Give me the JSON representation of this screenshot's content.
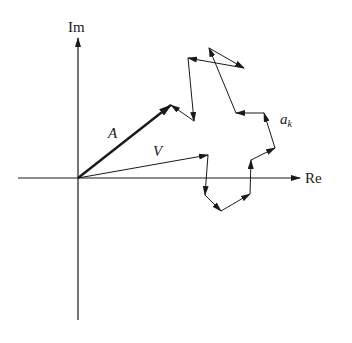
{
  "diagram": {
    "axes": {
      "x_label": "Re",
      "y_label": "Im",
      "origin": [
        78,
        178
      ]
    },
    "labels": {
      "resultant": "A",
      "vector_v": "V",
      "component": "a",
      "component_subscript": "k"
    },
    "vectors": {
      "A": {
        "from": [
          78,
          178
        ],
        "to": [
          171,
          105
        ]
      },
      "V": {
        "from": [
          78,
          178
        ],
        "to": [
          208,
          155
        ]
      }
    },
    "chain_points": [
      [
        208,
        155
      ],
      [
        205,
        195
      ],
      [
        221,
        211
      ],
      [
        250,
        194
      ],
      [
        251,
        160
      ],
      [
        275,
        148
      ],
      [
        264,
        113
      ],
      [
        236,
        113
      ],
      [
        209,
        48
      ],
      [
        244,
        68
      ],
      [
        188,
        58
      ],
      [
        194,
        121
      ],
      [
        171,
        105
      ]
    ],
    "colors": {
      "ink": "#1a1a1a",
      "background": "#ffffff"
    }
  }
}
